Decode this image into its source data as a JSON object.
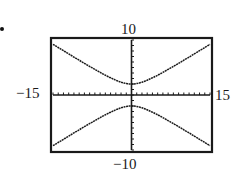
{
  "chart_data": {
    "type": "line",
    "title": "",
    "xlabel": "",
    "ylabel": "",
    "xlim": [
      -15,
      15
    ],
    "ylim": [
      -10,
      10
    ],
    "window_labels": {
      "ymax": "10",
      "ymin": "−10",
      "xmin": "−15",
      "xmax": "15"
    },
    "grid": false,
    "tick_marks": true,
    "series": [
      {
        "name": "upper branch",
        "equation": "y = sqrt(4 + 0.36x^2)",
        "vertex": [
          0,
          2
        ],
        "x": [
          -15,
          -10,
          -5,
          0,
          5,
          10,
          15
        ],
        "values": [
          9.2,
          6.3,
          3.6,
          2,
          3.6,
          6.3,
          9.2
        ]
      },
      {
        "name": "lower branch",
        "equation": "y = -sqrt(4 + 0.36x^2)",
        "vertex": [
          0,
          -2
        ],
        "x": [
          -15,
          -10,
          -5,
          0,
          5,
          10,
          15
        ],
        "values": [
          -9.2,
          -6.3,
          -3.6,
          -2,
          -3.6,
          -6.3,
          -9.2
        ]
      }
    ]
  },
  "labels": {
    "top": "10",
    "bottom": "−10",
    "left": "−15",
    "right": "15"
  },
  "colors": {
    "ink": "#1a1a1a",
    "background": "#ffffff"
  }
}
